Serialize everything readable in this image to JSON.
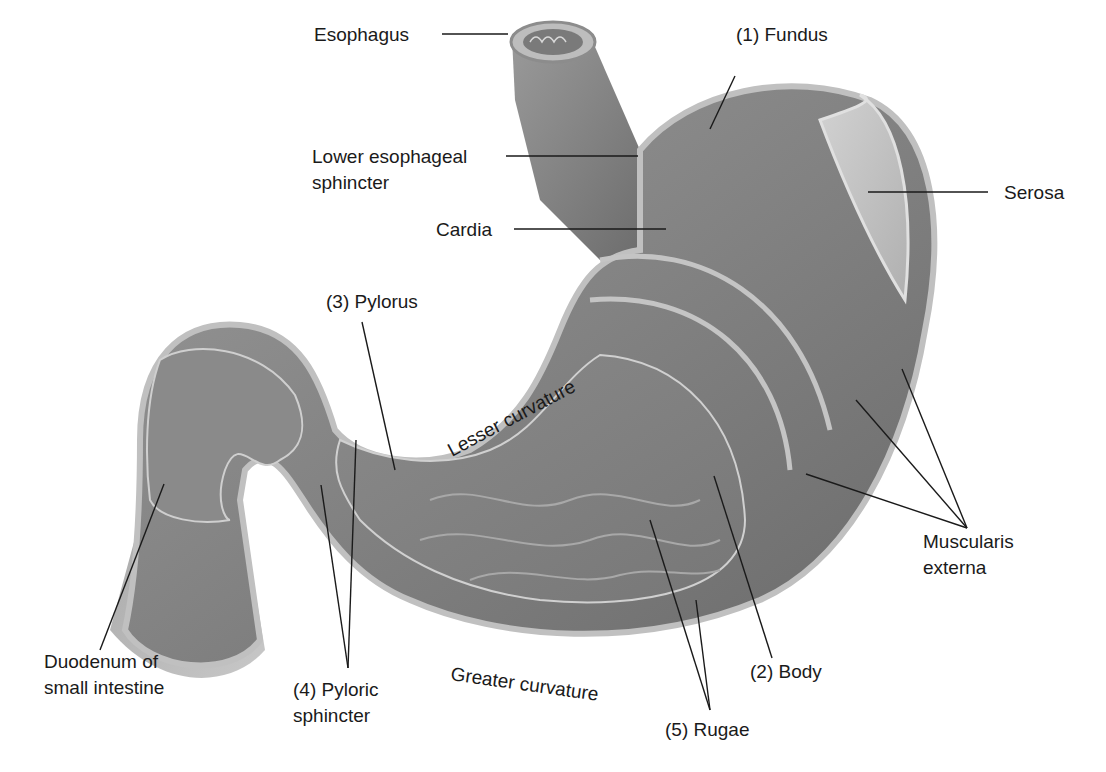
{
  "diagram": {
    "colors": {
      "background": "#ffffff",
      "tissue_dark": "#6e6e6e",
      "tissue_mid": "#8c8c8c",
      "tissue_light": "#b4b4b4",
      "serosa": "#c8c8c8",
      "label_text": "#1a1a1a"
    },
    "labels": {
      "esophagus": "Esophagus",
      "fundus": "(1) Fundus",
      "les_line1": "Lower esophageal",
      "les_line2": "sphincter",
      "serosa": "Serosa",
      "cardia": "Cardia",
      "pylorus": "(3) Pylorus",
      "lesser_curvature": "Lesser curvature",
      "muscularis_line1": "Muscularis",
      "muscularis_line2": "externa",
      "duodenum_line1": "Duodenum of",
      "duodenum_line2": "small intestine",
      "pyloric_sphincter_line1": "(4) Pyloric",
      "pyloric_sphincter_line2": "sphincter",
      "greater_curvature": "Greater curvature",
      "body": "(2) Body",
      "rugae": "(5) Rugae"
    }
  }
}
